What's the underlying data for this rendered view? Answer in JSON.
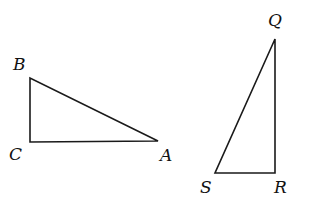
{
  "diagram": {
    "type": "geometry",
    "figures": [
      {
        "name": "triangle-BCA",
        "right_angle_at": "C",
        "vertices": [
          {
            "label": "B",
            "x": 30,
            "y": 78,
            "label_x": 13,
            "label_y": 70
          },
          {
            "label": "C",
            "x": 30,
            "y": 142,
            "label_x": 9,
            "label_y": 160
          },
          {
            "label": "A",
            "x": 158,
            "y": 141,
            "label_x": 160,
            "label_y": 161
          }
        ]
      },
      {
        "name": "triangle-QSR",
        "right_angle_at": "R",
        "vertices": [
          {
            "label": "Q",
            "x": 275,
            "y": 39,
            "label_x": 268,
            "label_y": 26
          },
          {
            "label": "S",
            "x": 215,
            "y": 173,
            "label_x": 200,
            "label_y": 193
          },
          {
            "label": "R",
            "x": 275,
            "y": 173,
            "label_x": 274,
            "label_y": 193
          }
        ]
      }
    ],
    "labels": {
      "B": "B",
      "C": "C",
      "A": "A",
      "Q": "Q",
      "S": "S",
      "R": "R"
    },
    "colors": {
      "line": "#1a1a1a",
      "text": "#111111",
      "background": "#ffffff"
    }
  }
}
